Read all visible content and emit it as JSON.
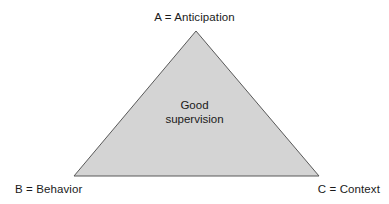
{
  "figure": {
    "name": "good-supervision-triangle",
    "background_color": "#ffffff",
    "shape": {
      "type": "triangle",
      "fill_color": "#d4d4d4",
      "stroke_color": "#595959",
      "stroke_width": 1,
      "apex": {
        "x": 196,
        "y": 31
      },
      "base_left": {
        "x": 74,
        "y": 176
      },
      "base_right": {
        "x": 319,
        "y": 176
      }
    },
    "inner_label": {
      "line1": "Good",
      "line2": "supervision"
    },
    "vertex_labels": {
      "apex": "A = Anticipation",
      "bottom_left": "B = Behavior",
      "bottom_right": "C = Context"
    }
  }
}
